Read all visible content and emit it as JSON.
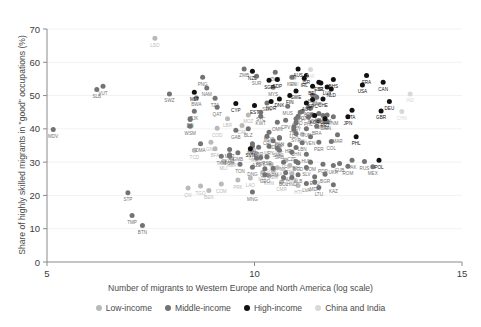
{
  "axis": {
    "ylabel": "Share of highly skilled migrants in \"good\" occupations (%)",
    "xlabel": "Number of migrants to Western Europe and North America (log scale)"
  },
  "legend": [
    {
      "label": "Low-income",
      "color": "#b9b9b9"
    },
    {
      "label": "Middle-income",
      "color": "#737373"
    },
    {
      "label": "High-income",
      "color": "#111111"
    },
    {
      "label": "China and India",
      "color": "#d8d8d8"
    }
  ],
  "chart_data": {
    "type": "scatter",
    "title": "",
    "xlabel": "Number of migrants to Western Europe and North America (log scale)",
    "ylabel": "Share of highly skilled migrants in \"good\" occupations (%)",
    "xlim": [
      5,
      15
    ],
    "ylim": [
      0,
      70
    ],
    "xticks": [
      5,
      10,
      15
    ],
    "yticks": [
      0,
      10,
      20,
      30,
      40,
      50,
      60,
      70
    ],
    "grid": "horizontal-faint",
    "legend_position": "bottom",
    "series": [
      {
        "name": "Low-income",
        "color": "#b9b9b9",
        "points": [
          {
            "label": "LSO",
            "x": 7.6,
            "y": 67.2
          },
          {
            "label": "MWI",
            "x": 10.95,
            "y": 55.5
          },
          {
            "label": "MOZ",
            "x": 9.85,
            "y": 44.2
          },
          {
            "label": "LBR",
            "x": 9.35,
            "y": 43.0
          },
          {
            "label": "CAF",
            "x": 9.7,
            "y": 41.0
          },
          {
            "label": "COD",
            "x": 9.1,
            "y": 40.2
          },
          {
            "label": "GIN",
            "x": 11.15,
            "y": 38.4
          },
          {
            "label": "GNB",
            "x": 8.95,
            "y": 36.0
          },
          {
            "label": "BFA",
            "x": 9.05,
            "y": 34.0
          },
          {
            "label": "SLE",
            "x": 10.6,
            "y": 34.8
          },
          {
            "label": "TCD",
            "x": 8.55,
            "y": 33.6
          },
          {
            "label": "BDI",
            "x": 9.95,
            "y": 33.2
          },
          {
            "label": "RWA",
            "x": 10.05,
            "y": 32.5
          },
          {
            "label": "ERI",
            "x": 10.3,
            "y": 31.5
          },
          {
            "label": "NER",
            "x": 9.45,
            "y": 31.0
          },
          {
            "label": "MLI",
            "x": 9.25,
            "y": 30.2
          },
          {
            "label": "AFG",
            "x": 10.75,
            "y": 30.6
          },
          {
            "label": "SOM",
            "x": 10.4,
            "y": 29.4
          },
          {
            "label": "ETH",
            "x": 10.85,
            "y": 29.0
          },
          {
            "label": "UGA",
            "x": 10.55,
            "y": 28.3
          },
          {
            "label": "YEM",
            "x": 10.45,
            "y": 27.6
          },
          {
            "label": "NPL",
            "x": 10.2,
            "y": 27.0
          },
          {
            "label": "MMR",
            "x": 10.9,
            "y": 26.5
          },
          {
            "label": "KHM",
            "x": 10.35,
            "y": 25.8
          },
          {
            "label": "LAO",
            "x": 9.9,
            "y": 25.2
          },
          {
            "label": "PRK",
            "x": 9.6,
            "y": 24.6
          },
          {
            "label": "CMR",
            "x": 10.65,
            "y": 24.0
          },
          {
            "label": "COM",
            "x": 9.2,
            "y": 23.4
          },
          {
            "label": "TGO",
            "x": 8.7,
            "y": 22.8
          },
          {
            "label": "CIV",
            "x": 8.4,
            "y": 22.2
          },
          {
            "label": "BEN",
            "x": 8.9,
            "y": 21.5
          },
          {
            "label": "HTI",
            "x": 11.05,
            "y": 23.0
          }
        ]
      },
      {
        "name": "Middle-income",
        "color": "#737373",
        "points": [
          {
            "label": "VUT",
            "x": 6.35,
            "y": 52.8
          },
          {
            "label": "SLB",
            "x": 6.2,
            "y": 51.8
          },
          {
            "label": "MDV",
            "x": 5.15,
            "y": 39.8
          },
          {
            "label": "STP",
            "x": 6.95,
            "y": 20.8
          },
          {
            "label": "TMP",
            "x": 7.05,
            "y": 14.0
          },
          {
            "label": "BTN",
            "x": 7.3,
            "y": 11.0
          },
          {
            "label": "PNG",
            "x": 8.75,
            "y": 55.5
          },
          {
            "label": "SWZ",
            "x": 7.95,
            "y": 50.5
          },
          {
            "label": "BWA",
            "x": 8.6,
            "y": 49.3
          },
          {
            "label": "NAM",
            "x": 8.85,
            "y": 52.3
          },
          {
            "label": "ZMB",
            "x": 9.75,
            "y": 58.0
          },
          {
            "label": "SUR",
            "x": 10.05,
            "y": 55.8
          },
          {
            "label": "ZWE",
            "x": 10.5,
            "y": 57.0
          },
          {
            "label": "TZA",
            "x": 9.05,
            "y": 49.2
          },
          {
            "label": "FJI",
            "x": 8.45,
            "y": 43.0
          },
          {
            "label": "TJK",
            "x": 8.55,
            "y": 45.3
          },
          {
            "label": "DJI",
            "x": 8.45,
            "y": 42.8
          },
          {
            "label": "WSM",
            "x": 8.45,
            "y": 40.8
          },
          {
            "label": "GAB",
            "x": 9.55,
            "y": 39.6
          },
          {
            "label": "DMA",
            "x": 8.7,
            "y": 35.5
          },
          {
            "label": "MRT",
            "x": 9.4,
            "y": 33.8
          },
          {
            "label": "KGZ",
            "x": 9.4,
            "y": 32.2
          },
          {
            "label": "TKM",
            "x": 9.2,
            "y": 31.8
          },
          {
            "label": "FSM",
            "x": 9.4,
            "y": 31.8
          },
          {
            "label": "TON",
            "x": 9.65,
            "y": 29.4
          },
          {
            "label": "DNG",
            "x": 9.95,
            "y": 28.5
          },
          {
            "label": "PSE",
            "x": 10.3,
            "y": 31.6
          },
          {
            "label": "GEO",
            "x": 10.25,
            "y": 26.2
          },
          {
            "label": "MNG",
            "x": 9.95,
            "y": 21.0
          },
          {
            "label": "KEN",
            "x": 10.9,
            "y": 55.5
          },
          {
            "label": "MYS",
            "x": 10.45,
            "y": 52.5
          },
          {
            "label": "SEN",
            "x": 10.3,
            "y": 47.8
          },
          {
            "label": "GHA",
            "x": 11.1,
            "y": 45.0
          },
          {
            "label": "AGO",
            "x": 11.4,
            "y": 44.2
          },
          {
            "label": "NGA",
            "x": 11.35,
            "y": 46.2
          },
          {
            "label": "PHL",
            "x": 11.3,
            "y": 43.5
          },
          {
            "label": "ARG",
            "x": 11.65,
            "y": 44.0
          },
          {
            "label": "TUR",
            "x": 11.55,
            "y": 42.4
          },
          {
            "label": "ZAF",
            "x": 11.7,
            "y": 42.2
          },
          {
            "label": "BRA",
            "x": 11.5,
            "y": 40.8
          },
          {
            "label": "THA",
            "x": 10.95,
            "y": 40.6
          },
          {
            "label": "MAR",
            "x": 12.0,
            "y": 38.2
          },
          {
            "label": "COL",
            "x": 11.85,
            "y": 36.2
          },
          {
            "label": "PER",
            "x": 11.55,
            "y": 36.0
          },
          {
            "label": "DZA",
            "x": 11.75,
            "y": 44.2
          },
          {
            "label": "TUN",
            "x": 11.25,
            "y": 40.0
          },
          {
            "label": "EGY",
            "x": 11.0,
            "y": 41.8
          },
          {
            "label": "IRQ",
            "x": 11.0,
            "y": 43.0
          },
          {
            "label": "JOR",
            "x": 10.1,
            "y": 34.5
          },
          {
            "label": "SVK",
            "x": 10.55,
            "y": 34.2
          },
          {
            "label": "CZE",
            "x": 10.9,
            "y": 33.0
          },
          {
            "label": "HUN",
            "x": 11.25,
            "y": 32.4
          },
          {
            "label": "BIH",
            "x": 11.0,
            "y": 30.2
          },
          {
            "label": "DOM",
            "x": 11.35,
            "y": 30.0
          },
          {
            "label": "NIC",
            "x": 10.7,
            "y": 30.0
          },
          {
            "label": "PDR",
            "x": 11.65,
            "y": 29.4
          },
          {
            "label": "UKR",
            "x": 11.9,
            "y": 29.0
          },
          {
            "label": "ROM",
            "x": 12.25,
            "y": 28.8
          },
          {
            "label": "PAK",
            "x": 12.35,
            "y": 30.6
          },
          {
            "label": "RUS",
            "x": 12.65,
            "y": 30.2
          },
          {
            "label": "MEX",
            "x": 12.85,
            "y": 28.6
          },
          {
            "label": "SLV",
            "x": 11.25,
            "y": 28.4
          },
          {
            "label": "SAU",
            "x": 10.75,
            "y": 26.8
          },
          {
            "label": "ALB",
            "x": 11.05,
            "y": 26.2
          },
          {
            "label": "ECU",
            "x": 11.45,
            "y": 25.6
          },
          {
            "label": "HND",
            "x": 10.9,
            "y": 25.4
          },
          {
            "label": "BOL",
            "x": 10.7,
            "y": 25.4
          },
          {
            "label": "BGD",
            "x": 11.05,
            "y": 29.8
          },
          {
            "label": "ARM",
            "x": 10.45,
            "y": 28.2
          },
          {
            "label": "AZE",
            "x": 10.05,
            "y": 31.2
          },
          {
            "label": "MKD",
            "x": 9.95,
            "y": 34.8
          },
          {
            "label": "UZB",
            "x": 10.25,
            "y": 28.0
          },
          {
            "label": "LVA",
            "x": 11.25,
            "y": 23.6
          },
          {
            "label": "MDA",
            "x": 11.45,
            "y": 24.0
          },
          {
            "label": "LTU",
            "x": 11.55,
            "y": 22.4
          },
          {
            "label": "KAZ",
            "x": 11.9,
            "y": 23.2
          },
          {
            "label": "BGR",
            "x": 11.7,
            "y": 26.4
          },
          {
            "label": "LBY",
            "x": 9.95,
            "y": 35.5
          },
          {
            "label": "URY",
            "x": 10.35,
            "y": 34.8
          },
          {
            "label": "HRV",
            "x": 10.85,
            "y": 35.2
          },
          {
            "label": "SRB",
            "x": 10.6,
            "y": 33.6
          },
          {
            "label": "CHN_alt",
            "x": 11.0,
            "y": 34.4
          },
          {
            "label": "VEN",
            "x": 11.35,
            "y": 37.6
          },
          {
            "label": "LBN",
            "x": 11.15,
            "y": 35.8
          },
          {
            "label": "BLZ",
            "x": 9.85,
            "y": 40.0
          },
          {
            "label": "CPV",
            "x": 10.75,
            "y": 42.6
          },
          {
            "label": "LCA",
            "x": 10.95,
            "y": 39.8
          },
          {
            "label": "JAM",
            "x": 11.55,
            "y": 44.6
          },
          {
            "label": "VNM",
            "x": 11.9,
            "y": 43.6
          },
          {
            "label": "IRN",
            "x": 11.75,
            "y": 42.2
          },
          {
            "label": "SYR",
            "x": 11.0,
            "y": 38.6
          },
          {
            "label": "OMN",
            "x": 10.55,
            "y": 42.0
          },
          {
            "label": "KWT",
            "x": 10.15,
            "y": 43.8
          },
          {
            "label": "ARE",
            "x": 11.3,
            "y": 46.4
          },
          {
            "label": "QAT",
            "x": 9.1,
            "y": 46.5
          },
          {
            "label": "BHR",
            "x": 11.5,
            "y": 49.5
          },
          {
            "label": "BRN",
            "x": 11.4,
            "y": 50.2
          },
          {
            "label": "GUY",
            "x": 10.6,
            "y": 37.2
          },
          {
            "label": "TTO",
            "x": 11.05,
            "y": 43.8
          },
          {
            "label": "MUS",
            "x": 10.8,
            "y": 46.8
          },
          {
            "label": "SYC",
            "x": 10.15,
            "y": 45.0
          },
          {
            "label": "VCT",
            "x": 11.15,
            "y": 45.2
          },
          {
            "label": "GMB",
            "x": 9.6,
            "y": 32.8
          },
          {
            "label": "CRI",
            "x": 10.3,
            "y": 37.8
          },
          {
            "label": "PAN",
            "x": 10.6,
            "y": 37.4
          },
          {
            "label": "PRY",
            "x": 10.15,
            "y": 31.4
          },
          {
            "label": "CUB",
            "x": 12.05,
            "y": 29.6
          },
          {
            "label": "SDN",
            "x": 10.45,
            "y": 36.4
          },
          {
            "label": "MDG",
            "x": 10.35,
            "y": 39.0
          }
        ]
      },
      {
        "name": "High-income",
        "color": "#111111",
        "points": [
          {
            "label": "BHS",
            "x": 11.9,
            "y": 54.8
          },
          {
            "label": "ISL",
            "x": 11.6,
            "y": 53.8
          },
          {
            "label": "LUX",
            "x": 11.75,
            "y": 52.6
          },
          {
            "label": "NZL",
            "x": 9.95,
            "y": 57.3
          },
          {
            "label": "AUS",
            "x": 11.05,
            "y": 58.0
          },
          {
            "label": "SGP",
            "x": 10.35,
            "y": 54.6
          },
          {
            "label": "IRL",
            "x": 11.2,
            "y": 55.2
          },
          {
            "label": "FRA",
            "x": 12.7,
            "y": 56.0
          },
          {
            "label": "CAN",
            "x": 13.1,
            "y": 54.0
          },
          {
            "label": "USA",
            "x": 12.6,
            "y": 53.2
          },
          {
            "label": "ESP",
            "x": 11.55,
            "y": 54.0
          },
          {
            "label": "BEL",
            "x": 11.4,
            "y": 52.8
          },
          {
            "label": "NLD",
            "x": 11.85,
            "y": 52.0
          },
          {
            "label": "SWE",
            "x": 11.0,
            "y": 51.4
          },
          {
            "label": "FIN",
            "x": 10.85,
            "y": 50.0
          },
          {
            "label": "DNK",
            "x": 10.6,
            "y": 49.0
          },
          {
            "label": "GRC",
            "x": 11.4,
            "y": 48.8
          },
          {
            "label": "CHE",
            "x": 11.65,
            "y": 49.0
          },
          {
            "label": "AUT",
            "x": 11.25,
            "y": 47.8
          },
          {
            "label": "NOR",
            "x": 10.4,
            "y": 48.2
          },
          {
            "label": "MLT",
            "x": 8.55,
            "y": 51.0
          },
          {
            "label": "CYP",
            "x": 9.55,
            "y": 47.6
          },
          {
            "label": "EST",
            "x": 10.0,
            "y": 47.0
          },
          {
            "label": "DEU",
            "x": 13.25,
            "y": 48.2
          },
          {
            "label": "GBR",
            "x": 13.05,
            "y": 45.4
          },
          {
            "label": "ITA",
            "x": 12.35,
            "y": 45.6
          },
          {
            "label": "JPN",
            "x": 12.25,
            "y": 43.6
          },
          {
            "label": "PRT",
            "x": 11.7,
            "y": 43.0
          },
          {
            "label": "POL",
            "x": 13.0,
            "y": 30.6
          },
          {
            "label": "SVN",
            "x": 9.9,
            "y": 34.0
          },
          {
            "label": "KOR",
            "x": 11.45,
            "y": 44.0
          },
          {
            "label": "ISR",
            "x": 11.25,
            "y": 56.0
          },
          {
            "label": "PHL2",
            "x": 12.45,
            "y": 37.6
          },
          {
            "label": "SDP",
            "x": 10.55,
            "y": 54.8
          }
        ]
      },
      {
        "name": "China and India",
        "color": "#d8d8d8",
        "points": [
          {
            "label": "IND",
            "x": 13.75,
            "y": 50.5
          },
          {
            "label": "CHN",
            "x": 13.55,
            "y": 45.2
          },
          {
            "label": "ZAF2",
            "x": 11.35,
            "y": 57.8
          }
        ]
      }
    ]
  }
}
